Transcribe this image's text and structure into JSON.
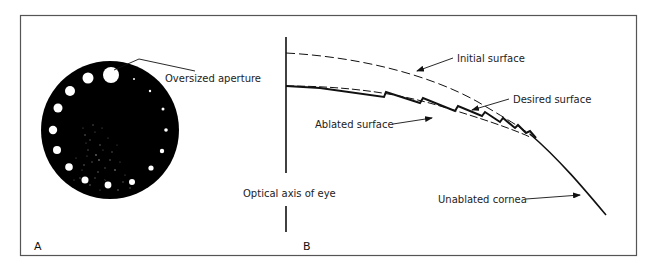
{
  "figure": {
    "panels": [
      {
        "id": "A",
        "label": "A",
        "description": "Aperture disk with graduated holes",
        "annotations": [
          {
            "text": "Oversized aperture"
          }
        ]
      },
      {
        "id": "B",
        "label": "B",
        "description": "Cross-section of corneal ablation profile",
        "annotations": [
          {
            "text": "Initial surface"
          },
          {
            "text": "Desired surface"
          },
          {
            "text": "Ablated surface"
          },
          {
            "text": "Optical axis of eye"
          },
          {
            "text": "Unablated cornea"
          }
        ]
      }
    ],
    "colors": {
      "ink": "#111111",
      "frame": "#555555",
      "background": "#ffffff"
    }
  }
}
